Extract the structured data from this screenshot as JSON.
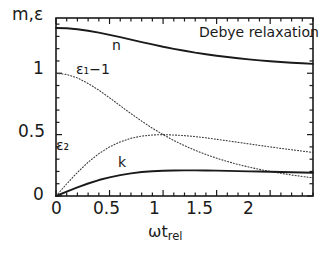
{
  "chart_data": {
    "type": "line",
    "title": "Debye relaxation",
    "xlabel": "ωt_rel",
    "ylabel": "m,ε",
    "xlim": [
      0,
      2.4
    ],
    "ylim": [
      0,
      1.45
    ],
    "grid": false,
    "legend": "inline-curve-labels",
    "xticks": [
      0,
      0.5,
      1,
      1.5,
      2
    ],
    "xticklabels": [
      "0",
      "0.5",
      "1",
      "1.5",
      "2"
    ],
    "yticks": [
      0,
      0.5,
      1
    ],
    "yticklabels": [
      "0",
      "0.5",
      "1"
    ],
    "x": [
      0,
      0.1,
      0.2,
      0.3,
      0.4,
      0.5,
      0.6,
      0.7,
      0.8,
      0.9,
      1.0,
      1.1,
      1.2,
      1.3,
      1.4,
      1.5,
      1.6,
      1.7,
      1.8,
      1.9,
      2.0,
      2.1,
      2.2,
      2.3,
      2.4
    ],
    "series": [
      {
        "name": "n",
        "label": "n",
        "style": "solid",
        "color": "#1a1a1a",
        "values": [
          1.368,
          1.366,
          1.358,
          1.346,
          1.331,
          1.313,
          1.294,
          1.274,
          1.254,
          1.235,
          1.216,
          1.199,
          1.183,
          1.168,
          1.155,
          1.143,
          1.132,
          1.122,
          1.113,
          1.105,
          1.098,
          1.092,
          1.086,
          1.081,
          1.076
        ]
      },
      {
        "name": "epsilon1_minus_1",
        "label": "ε₁−1",
        "style": "dotted",
        "color": "#3a3a3a",
        "values": [
          1.0,
          0.99,
          0.962,
          0.917,
          0.862,
          0.8,
          0.735,
          0.671,
          0.61,
          0.552,
          0.5,
          0.452,
          0.41,
          0.372,
          0.338,
          0.308,
          0.281,
          0.257,
          0.236,
          0.217,
          0.2,
          0.185,
          0.171,
          0.159,
          0.148
        ]
      },
      {
        "name": "epsilon2",
        "label": "ε₂",
        "style": "dotted",
        "color": "#3a3a3a",
        "values": [
          0.0,
          0.099,
          0.192,
          0.275,
          0.345,
          0.4,
          0.441,
          0.47,
          0.488,
          0.497,
          0.5,
          0.497,
          0.492,
          0.484,
          0.474,
          0.462,
          0.45,
          0.437,
          0.425,
          0.412,
          0.4,
          0.388,
          0.377,
          0.366,
          0.355
        ]
      },
      {
        "name": "k",
        "label": "k",
        "style": "solid",
        "color": "#1a1a1a",
        "values": [
          0.0,
          0.036,
          0.071,
          0.102,
          0.13,
          0.152,
          0.17,
          0.184,
          0.195,
          0.202,
          0.206,
          0.208,
          0.209,
          0.209,
          0.208,
          0.207,
          0.205,
          0.203,
          0.201,
          0.199,
          0.197,
          0.195,
          0.193,
          0.191,
          0.189
        ]
      }
    ],
    "annotations": [
      {
        "text": "Debye relaxation",
        "x": 1.55,
        "y": 1.32
      },
      {
        "text": "n",
        "x": 0.55,
        "y": 1.22
      },
      {
        "text": "ε₁−1",
        "x": 0.21,
        "y": 1.02
      },
      {
        "text": "ε₂",
        "x": 0.03,
        "y": 0.47
      },
      {
        "text": "k",
        "x": 0.6,
        "y": 0.33
      }
    ]
  },
  "axes": {
    "ylabel_text": "m,ε",
    "xlabel_omega": "ωt",
    "xlabel_sub": "rel",
    "ytick_labels": {
      "zero": "0",
      "half": "0.5",
      "one": "1"
    },
    "xtick_labels": {
      "t0": "0",
      "t05": "0.5",
      "t1": "1",
      "t15": "1.5",
      "t2": "2"
    }
  },
  "labels": {
    "note": "Debye relaxation",
    "n": "n",
    "eps1": "ε₁−1",
    "eps2": "ε₂",
    "k": "k"
  },
  "colors": {
    "ink": "#1a1a1a",
    "dotted": "#3a3a3a",
    "background": "#ffffff"
  }
}
